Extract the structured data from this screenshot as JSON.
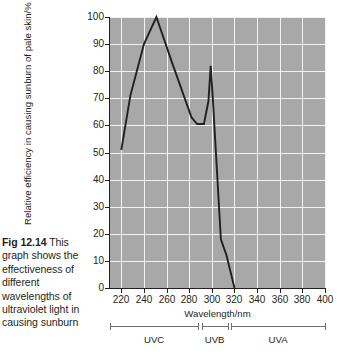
{
  "caption": {
    "figure_number": "Fig 12.14",
    "text": "This graph shows the effectiveness of different wavelengths of ultraviolet light in causing sunburn"
  },
  "chart_data": {
    "type": "line",
    "title": "",
    "xlabel": "Wavelength/nm",
    "ylabel": "Relative efficiency in causing sunburn of pale skin/%",
    "xlim": [
      210,
      400
    ],
    "ylim": [
      0,
      100
    ],
    "grid": true,
    "legend_position": "none",
    "x_ticks": [
      220,
      240,
      260,
      280,
      300,
      320,
      340,
      360,
      380,
      400
    ],
    "y_ticks": [
      0,
      10,
      20,
      30,
      40,
      50,
      60,
      70,
      80,
      90,
      100
    ],
    "x_tick_labels": [
      "220",
      "240",
      "260",
      "280",
      "300",
      "320",
      "340",
      "360",
      "380",
      "400"
    ],
    "y_tick_labels": [
      "0",
      "10",
      "20",
      "30",
      "40",
      "50",
      "60",
      "70",
      "80",
      "90",
      "100"
    ],
    "series": [
      {
        "name": "Relative efficiency",
        "color": "#231f20",
        "x": [
          220,
          228,
          240,
          251,
          265,
          282,
          287,
          293,
          297,
          299,
          301,
          308,
          313,
          320
        ],
        "y": [
          51,
          71,
          90,
          100,
          83,
          63,
          60.5,
          60.5,
          69,
          82,
          69,
          18,
          12,
          0
        ]
      }
    ],
    "bands": [
      {
        "name": "UVC",
        "label": "UVC",
        "start": 210,
        "end": 288
      },
      {
        "name": "UVB",
        "label": "UVB",
        "start": 291,
        "end": 314
      },
      {
        "name": "UVA",
        "label": "UVA",
        "start": 317,
        "end": 400
      }
    ],
    "colors": {
      "plot_background": "#a8a8a8",
      "gridline": "#f2f2f2",
      "line": "#231f20",
      "axis": "#231f20",
      "band_rule": "#6d6e71"
    }
  }
}
